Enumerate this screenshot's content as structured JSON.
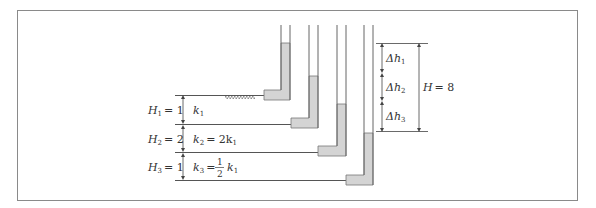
{
  "figure": {
    "colors": {
      "frame": "#8a8a8a",
      "line": "#555555",
      "water": "#d4d4d4",
      "hatch": "#9a9a9a"
    },
    "layers": [
      {
        "height_label": "H",
        "height_sub": "1",
        "height_value": "= 1",
        "k_label": "k",
        "k_sub": "1",
        "k_rest": ""
      },
      {
        "height_label": "H",
        "height_sub": "2",
        "height_value": "= 2",
        "k_label": "k",
        "k_sub": "2",
        "k_rest": "= 2k",
        "k_rest_sub": "1"
      },
      {
        "height_label": "H",
        "height_sub": "3",
        "height_value": "= 1",
        "k_label": "k",
        "k_sub": "3",
        "k_rest": "=",
        "fraction_num": "1",
        "fraction_den": "2",
        "k_tail": "k",
        "k_tail_sub": "1"
      }
    ],
    "head_losses": [
      {
        "label": "Δh",
        "sub": "1"
      },
      {
        "label": "Δh",
        "sub": "2"
      },
      {
        "label": "Δh",
        "sub": "3"
      }
    ],
    "total_head": {
      "label": "H",
      "value": "= 8"
    }
  }
}
